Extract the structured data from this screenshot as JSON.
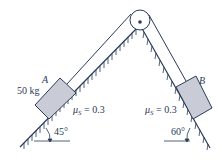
{
  "diagram": {
    "type": "two-incline pulley system",
    "block_a": {
      "label": "A",
      "mass_label": "50 kg",
      "friction_label": "μS = 0.3",
      "mu": "μ",
      "mu_sub": "S",
      "mu_val": " = 0.3"
    },
    "block_b": {
      "label": "B",
      "friction_label": "μS = 0.3",
      "mu": "μ",
      "mu_sub": "S",
      "mu_val": " = 0.3"
    },
    "left_incline_angle": "45°",
    "right_incline_angle": "60°",
    "colors": {
      "line": "#2a3a5a",
      "block_fill": "#c9ccd6",
      "block_stroke": "#2a3a5a"
    }
  }
}
